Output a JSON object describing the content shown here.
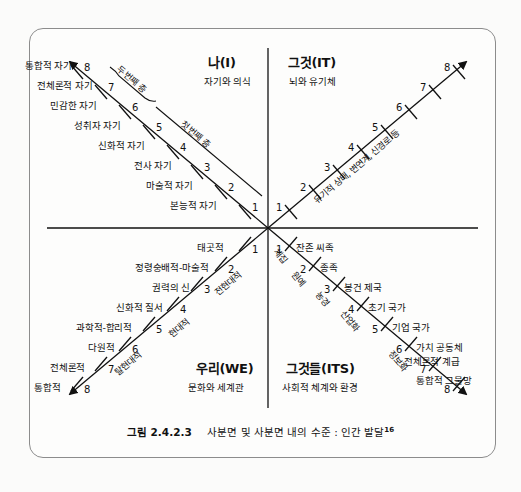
{
  "figure": {
    "caption_number": "그림 2.4.2.3",
    "caption_text": "사분면 및 사분면 내의 수준 : 인간 발달",
    "caption_superscript": "16"
  },
  "quadrants": {
    "upper_left": {
      "title": "나(I)",
      "subtitle": "자기와 의식",
      "axis_label_lower": "첫 번째 층",
      "axis_label_upper": "두 번째 층",
      "levels": [
        {
          "n": "1",
          "label": "본능적 자기"
        },
        {
          "n": "2",
          "label": "마술적 자기"
        },
        {
          "n": "3",
          "label": "전사 자기"
        },
        {
          "n": "4",
          "label": "신화적 자기"
        },
        {
          "n": "5",
          "label": "성취자 자기"
        },
        {
          "n": "6",
          "label": "민감한 자기"
        },
        {
          "n": "7",
          "label": "전체론적 자기"
        },
        {
          "n": "8",
          "label": "통합적 자기"
        }
      ]
    },
    "upper_right": {
      "title": "그것(IT)",
      "subtitle": "뇌와 유기체",
      "axis_label": "유기적 상태, 변연계, 신경로 등",
      "levels": [
        {
          "n": "1",
          "label": ""
        },
        {
          "n": "2",
          "label": ""
        },
        {
          "n": "3",
          "label": ""
        },
        {
          "n": "4",
          "label": ""
        },
        {
          "n": "5",
          "label": ""
        },
        {
          "n": "6",
          "label": ""
        },
        {
          "n": "7",
          "label": ""
        },
        {
          "n": "8",
          "label": ""
        }
      ]
    },
    "lower_left": {
      "title": "우리(WE)",
      "subtitle": "문화와 세계관",
      "era_labels": [
        "전현대적",
        "현대적",
        "탈현대적"
      ],
      "levels": [
        {
          "n": "1",
          "label": "태곳적"
        },
        {
          "n": "2",
          "label": "정령숭배적-마술적"
        },
        {
          "n": "3",
          "label": "권력의 신"
        },
        {
          "n": "4",
          "label": "신화적 질서"
        },
        {
          "n": "5",
          "label": "과학적-합리적"
        },
        {
          "n": "6",
          "label": "다원적"
        },
        {
          "n": "7",
          "label": "전체론적"
        },
        {
          "n": "8",
          "label": "통합적"
        }
      ]
    },
    "lower_right": {
      "title": "그것들(ITS)",
      "subtitle": "사회적 체계와 환경",
      "era_labels": [
        "채집",
        "원예",
        "농경",
        "산업화",
        "정보화"
      ],
      "levels": [
        {
          "n": "1",
          "label": "잔존 씨족"
        },
        {
          "n": "2",
          "label": "종족"
        },
        {
          "n": "3",
          "label": "봉건 제국"
        },
        {
          "n": "4",
          "label": "초기 국가"
        },
        {
          "n": "5",
          "label": "기업 국가"
        },
        {
          "n": "6",
          "label": "가치 공동체"
        },
        {
          "n": "7",
          "label": "전체론적 계급"
        },
        {
          "n": "8",
          "label": "통합적 그물망"
        }
      ]
    }
  },
  "colors": {
    "ink": "#111111",
    "frame": "#8c8c8c",
    "paper": "#fdfdfc"
  }
}
